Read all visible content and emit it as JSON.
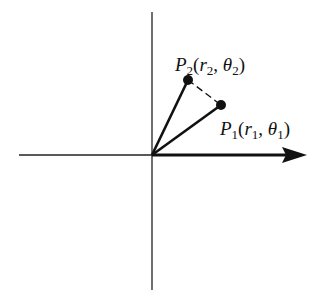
{
  "diagram": {
    "type": "polar-coordinates",
    "origin": {
      "x": 152,
      "y": 155
    },
    "points": [
      {
        "id": "P1",
        "name": "P",
        "sub": "1",
        "r": "r",
        "r_sub": "1",
        "theta": "θ",
        "theta_sub": "1",
        "x": 221,
        "y": 105
      },
      {
        "id": "P2",
        "name": "P",
        "sub": "2",
        "r": "r",
        "r_sub": "2",
        "theta": "θ",
        "theta_sub": "2",
        "x": 188,
        "y": 80
      }
    ],
    "labels": {
      "p1": {
        "P": "P",
        "sub": "1",
        "open": "(",
        "r": "r",
        "rsub": "1",
        "comma": ", ",
        "theta": "θ",
        "tsub": "1",
        "close": ")"
      },
      "p2": {
        "P": "P",
        "sub": "2",
        "open": "(",
        "r": "r",
        "rsub": "2",
        "comma": ", ",
        "theta": "θ",
        "tsub": "2",
        "close": ")"
      }
    },
    "colors": {
      "line": "#111111",
      "background": "#ffffff"
    }
  }
}
